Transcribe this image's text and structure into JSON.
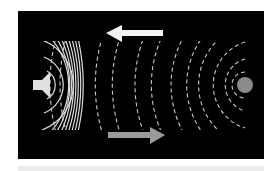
{
  "diagram": {
    "background": "#000000",
    "source": {
      "icon": "speaker-icon",
      "color": "#e0e0e0"
    },
    "reflector": {
      "icon": "circle-reflector",
      "color": "#8a8a8a"
    },
    "incident_waves": {
      "style": "solid",
      "color": "#dcdcdc",
      "count": 11,
      "direction": "right"
    },
    "reflected_waves": {
      "style": "dashed",
      "color": "#c8c8c8",
      "count": 12,
      "direction": "left"
    },
    "arrows": [
      {
        "direction": "left",
        "color": "#f2f2f2",
        "meaning": "reflected wave direction"
      },
      {
        "direction": "right",
        "color": "#9a9a9a",
        "meaning": "incident wave direction"
      }
    ],
    "footer_bar_color": "#ececec"
  }
}
